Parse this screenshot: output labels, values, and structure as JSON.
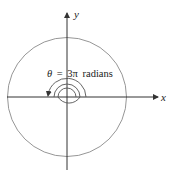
{
  "diagram": {
    "type": "polar-angle",
    "axes": {
      "x_label": "x",
      "y_label": "y"
    },
    "annotation": {
      "theta_symbol": "θ",
      "equals": "=",
      "value": "3π",
      "unit": "radians"
    },
    "circle": {
      "description": "Large circle centered at origin"
    },
    "spiral": {
      "description": "Counter-clockwise spiral arrow sweeping 3π radians, ending on negative x-axis"
    },
    "colors": {
      "axis": "#333333",
      "circle": "#8a8a8a",
      "spiral": "#555555",
      "text": "#222222"
    }
  }
}
